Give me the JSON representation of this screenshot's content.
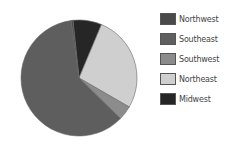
{
  "chart_data": {
    "type": "pie",
    "title": "",
    "categories": [
      "Northwest",
      "Southeast",
      "Southwest",
      "Northeast",
      "Midwest"
    ],
    "values": [
      0.5,
      60.5,
      4,
      27,
      8
    ],
    "colors": [
      "#4a4a4a",
      "#5e5e5e",
      "#8c8c8c",
      "#cfcfcf",
      "#262626"
    ],
    "start_angle_deg": -6,
    "direction": "clockwise",
    "slice_order": [
      "Midwest",
      "Northeast",
      "Southwest",
      "Southeast",
      "Northwest"
    ],
    "legend_position": "right"
  },
  "legend": {
    "items": [
      {
        "label": "Northwest",
        "color": "#4a4a4a"
      },
      {
        "label": "Southeast",
        "color": "#5e5e5e"
      },
      {
        "label": "Southwest",
        "color": "#8c8c8c"
      },
      {
        "label": "Northeast",
        "color": "#cfcfcf"
      },
      {
        "label": "Midwest",
        "color": "#262626"
      }
    ]
  }
}
